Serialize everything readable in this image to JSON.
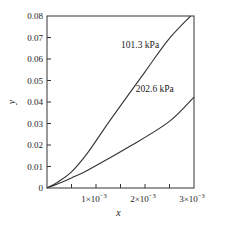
{
  "chart_data": {
    "type": "line",
    "title": "",
    "xlabel": "x",
    "ylabel": "y",
    "xlim": [
      0,
      0.003
    ],
    "ylim": [
      0,
      0.08
    ],
    "grid": false,
    "x_ticks": [
      0.0005,
      0.001,
      0.0015,
      0.002,
      0.0025
    ],
    "x_tick_labels": [
      {
        "value": 0.001,
        "mantissa": "1",
        "exp": "−3"
      },
      {
        "value": 0.002,
        "mantissa": "2",
        "exp": "−3"
      },
      {
        "value": 0.003,
        "mantissa": "3",
        "exp": "−3"
      }
    ],
    "y_ticks": [
      0,
      0.01,
      0.02,
      0.03,
      0.04,
      0.05,
      0.06,
      0.07,
      0.08
    ],
    "y_tick_labels": [
      "0",
      "0.01",
      "0.02",
      "0.03",
      "0.04",
      "0.05",
      "0.06",
      "0.07",
      "0.08"
    ],
    "series": [
      {
        "name": "101.3 kPa",
        "x": [
          0,
          0.0002,
          0.0005,
          0.00084,
          0.00129,
          0.002,
          0.00247,
          0.00293
        ],
        "y": [
          0,
          0.0025,
          0.0075,
          0.0167,
          0.0316,
          0.054,
          0.0688,
          0.08
        ],
        "label": "101.3 kPa",
        "label_at": [
          0.0019,
          0.065
        ]
      },
      {
        "name": "202.6 kPa",
        "x": [
          0,
          0.0002,
          0.0005,
          0.00084,
          0.0017,
          0.0025,
          0.003
        ],
        "y": [
          0,
          0.0018,
          0.0047,
          0.0084,
          0.0195,
          0.031,
          0.0423
        ],
        "label": "202.6 kPa",
        "label_at": [
          0.0022,
          0.0445
        ]
      }
    ]
  }
}
